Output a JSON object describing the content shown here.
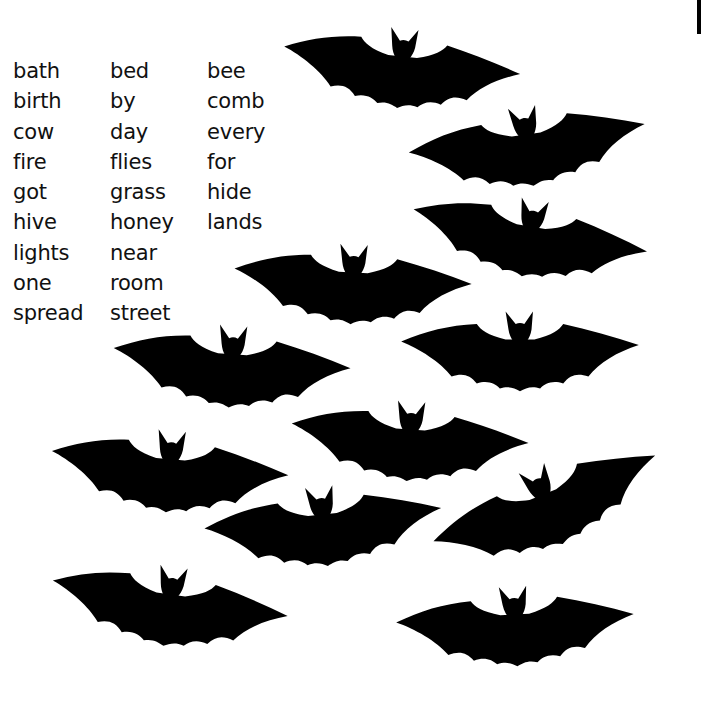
{
  "worksheet": {
    "word_bank": {
      "columns": [
        [
          "bath",
          "birth",
          "cow",
          "fire",
          "got",
          "hive",
          "lights",
          "one",
          "spread"
        ],
        [
          "bed",
          "by",
          "day",
          "flies",
          "grass",
          "honey",
          "near",
          "room",
          "street"
        ],
        [
          "bee",
          "comb",
          "every",
          "for",
          "hide",
          "lands"
        ]
      ]
    },
    "illustration": {
      "subject": "bat-outlines",
      "bat_count": 12,
      "line_color": "#111111",
      "background_color": "#ffffff"
    }
  }
}
